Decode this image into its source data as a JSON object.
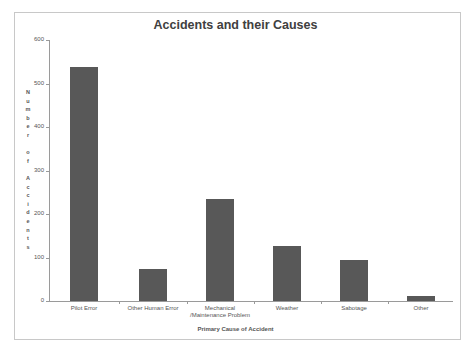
{
  "chart_data": {
    "type": "bar",
    "title": "Accidents and their Causes",
    "xlabel": "Primary Cause of Accident",
    "ylabel": "Number of Accidents",
    "categories": [
      "Pilot Error",
      "Other Human Error",
      "Mechanical /Maintenance Problem",
      "Weather",
      "Sabotage",
      "Other"
    ],
    "values": [
      538,
      74,
      234,
      126,
      94,
      12
    ],
    "ylim": [
      0,
      600
    ],
    "yticks": [
      0,
      100,
      200,
      300,
      400,
      500,
      600
    ],
    "grid": false,
    "legend": "none",
    "bar_color": "#585858"
  },
  "labels": {
    "title": "Accidents and their Causes",
    "xtitle": "Primary Cause of Accident",
    "ytitle_chars": [
      "N",
      "u",
      "m",
      "b",
      "e",
      "r",
      "",
      "o",
      "f",
      "",
      "A",
      "c",
      "c",
      "i",
      "d",
      "e",
      "n",
      "t",
      "s"
    ],
    "yticks": [
      "0",
      "100",
      "200",
      "300",
      "400",
      "500",
      "600"
    ],
    "categories": [
      "Pilot Error",
      "Other Human Error",
      "Mechanical",
      "Weather",
      "Sabotage",
      "Other"
    ],
    "category_line2": [
      "",
      "",
      "/Maintenance Problem",
      "",
      "",
      ""
    ]
  }
}
